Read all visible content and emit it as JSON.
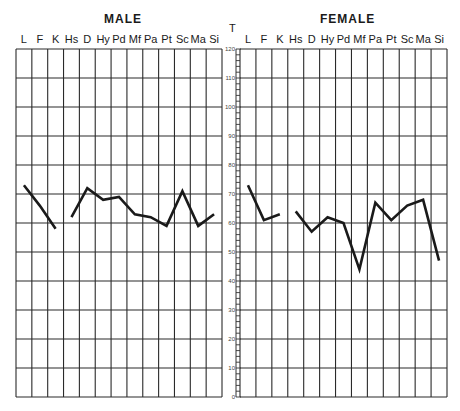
{
  "chart_data": {
    "type": "line",
    "axis_label": "T",
    "scale": {
      "min": 0,
      "max": 120,
      "major_step": 10,
      "minor_step": 2,
      "tick_labels": [
        "0",
        "10",
        "20",
        "30",
        "40",
        "50",
        "60",
        "70",
        "80",
        "90",
        "100",
        "110",
        "120"
      ]
    },
    "categories": [
      "L",
      "F",
      "K",
      "Hs",
      "D",
      "Hy",
      "Pd",
      "Mf",
      "Pa",
      "Pt",
      "Sc",
      "Ma",
      "Si"
    ],
    "panels": [
      {
        "title": "MALE",
        "segments": [
          {
            "categories": [
              "L",
              "F",
              "K"
            ],
            "values": [
              73,
              66,
              58
            ]
          },
          {
            "categories": [
              "Hs",
              "D",
              "Hy",
              "Pd",
              "Mf",
              "Pa",
              "Pt",
              "Sc",
              "Ma",
              "Si"
            ],
            "values": [
              62,
              72,
              68,
              69,
              63,
              62,
              59,
              71,
              59,
              63
            ]
          }
        ]
      },
      {
        "title": "FEMALE",
        "segments": [
          {
            "categories": [
              "L",
              "F",
              "K"
            ],
            "values": [
              73,
              61,
              63
            ]
          },
          {
            "categories": [
              "Hs",
              "D",
              "Hy",
              "Pd",
              "Mf",
              "Pa",
              "Pt",
              "Sc",
              "Ma",
              "Si"
            ],
            "values": [
              64,
              57,
              62,
              60,
              44,
              67,
              61,
              66,
              68,
              47
            ]
          }
        ]
      }
    ],
    "grid": true
  },
  "labels": {
    "male_title": "MALE",
    "female_title": "FEMALE",
    "axis_t": "T"
  },
  "colors": {
    "grid": "#2a2a2a",
    "line": "#1a1a1a",
    "scale_text": "#444444"
  }
}
